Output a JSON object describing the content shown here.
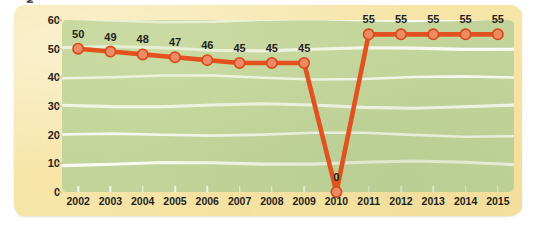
{
  "chart_data": {
    "type": "line",
    "title": "",
    "subtitle": "",
    "xlabel": "",
    "ylabel": "Maximum Estate Tax Rates (%)",
    "categories": [
      "2002",
      "2003",
      "2004",
      "2005",
      "2006",
      "2007",
      "2008",
      "2009",
      "2010",
      "2011",
      "2012",
      "2013",
      "2014",
      "2015"
    ],
    "values": [
      50,
      49,
      48,
      47,
      46,
      45,
      45,
      45,
      0,
      55,
      55,
      55,
      55,
      55
    ],
    "point_labels": [
      "50",
      "49",
      "48",
      "47",
      "46",
      "45",
      "45",
      "45",
      "0",
      "55",
      "55",
      "55",
      "55",
      "55"
    ],
    "series": [
      {
        "name": "Maximum Estate Tax Rate",
        "values": [
          50,
          49,
          48,
          47,
          46,
          45,
          45,
          45,
          0,
          55,
          55,
          55,
          55,
          55
        ]
      }
    ],
    "ylim": [
      0,
      60
    ],
    "y_ticks": [
      0,
      10,
      20,
      30,
      40,
      50,
      60
    ],
    "y_tick_labels": [
      "0",
      "10",
      "20",
      "30",
      "40",
      "50",
      "60"
    ],
    "grid": true,
    "grid_style": "horizontal-wavy-white",
    "legend": "none",
    "legend_position": "none",
    "annotations": []
  },
  "colors": {
    "page_background": "#ffffff",
    "mat_background": "#f7e5a8",
    "plot_background": "#c2d49a",
    "gridline": "#ffffff",
    "line": "#e2511e",
    "marker_fill": "#ef8b64",
    "marker_stroke": "#d8491a",
    "text": "#231f20"
  }
}
